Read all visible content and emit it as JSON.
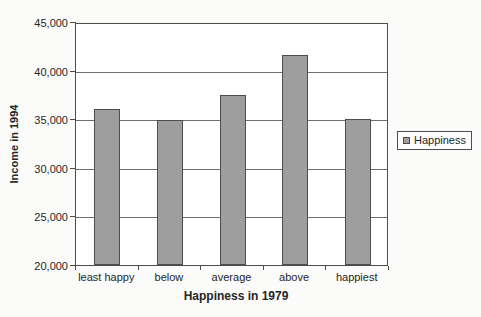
{
  "chart_data": {
    "type": "bar",
    "categories": [
      "least happy",
      "below",
      "average",
      "above",
      "happiest"
    ],
    "values": [
      36100,
      34900,
      37500,
      41600,
      35000
    ],
    "series": [
      {
        "name": "Happiness",
        "values": [
          36100,
          34900,
          37500,
          41600,
          35000
        ]
      }
    ],
    "title": "",
    "xlabel": "Happiness in 1979",
    "ylabel": "Income in 1994",
    "ylim": [
      20000,
      45000
    ],
    "yticks": [
      20000,
      25000,
      30000,
      35000,
      40000,
      45000
    ],
    "ytick_labels": [
      "20,000",
      "25,000",
      "30,000",
      "35,000",
      "40,000",
      "45,000"
    ],
    "grid": true,
    "legend": {
      "label": "Happiness",
      "position": "right"
    },
    "colors": {
      "bar_fill": "#9e9e9e",
      "bar_border": "#4d4d4d",
      "grid_line": "#6f6f6f",
      "plot_border": "#4d4d4d",
      "plot_background": "#ffffff",
      "text": "#262626",
      "background": "#fbfbfa"
    }
  }
}
